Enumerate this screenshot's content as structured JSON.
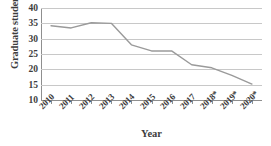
{
  "chart_data": {
    "type": "line",
    "title": "",
    "xlabel": "Year",
    "ylabel": "Graduate students",
    "categories": [
      "2010",
      "2011",
      "2012",
      "2013",
      "2014",
      "2015",
      "2016",
      "2017",
      "2018*",
      "2019*",
      "2020*"
    ],
    "values": [
      34.2,
      33.5,
      35.2,
      35.0,
      28.0,
      26.0,
      26.0,
      21.5,
      20.5,
      18.0,
      15.2
    ],
    "series": [
      {
        "name": "Graduate students",
        "values": [
          34.2,
          33.5,
          35.2,
          35.0,
          28.0,
          26.0,
          26.0,
          21.5,
          20.5,
          18.0,
          15.2
        ]
      }
    ],
    "ylim": [
      10,
      40
    ],
    "yticks": [
      40,
      35,
      30,
      25,
      20,
      15,
      10
    ],
    "ytick_labels": [
      "40",
      "35",
      "30",
      "25",
      "20",
      "15",
      "10"
    ],
    "grid": true,
    "grid_axis": "y",
    "legend": false,
    "legend_position": "none",
    "line_color": "#9a9a9a",
    "grid_color": "#c8c8c8",
    "axis_color": "#8f8f8f",
    "text_color": "#3d3d3d",
    "background": "#ffffff",
    "markers": false,
    "annotations": []
  }
}
